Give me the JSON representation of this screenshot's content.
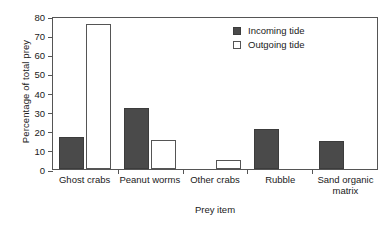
{
  "chart_data": {
    "type": "bar",
    "title": "",
    "xlabel": "Prey item",
    "ylabel": "Percentage of total prey",
    "ylim": [
      0,
      80
    ],
    "yticks": [
      0,
      10,
      20,
      30,
      40,
      50,
      60,
      70,
      80
    ],
    "grid": false,
    "legend_position": "top-right",
    "categories": [
      "Ghost crabs",
      "Peanut worms",
      "Other crabs",
      "Rubble",
      "Sand organic\nmatrix"
    ],
    "series": [
      {
        "name": "Incoming tide",
        "color": "#4a4a4a",
        "values": [
          16.5,
          32,
          0,
          21,
          14.5
        ]
      },
      {
        "name": "Outgoing tide",
        "color": "#ffffff",
        "values": [
          76,
          15,
          4.5,
          0,
          0
        ]
      }
    ]
  },
  "legend": {
    "items": [
      {
        "label": "Incoming tide",
        "style": "incoming"
      },
      {
        "label": "Outgoing tide",
        "style": "outgoing"
      }
    ]
  },
  "axes": {
    "y_tick_labels": [
      "80",
      "70",
      "60",
      "50",
      "40",
      "30",
      "20",
      "10",
      "0"
    ]
  }
}
